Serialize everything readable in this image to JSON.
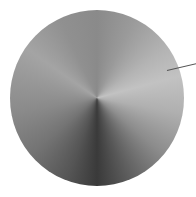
{
  "knob": {
    "type": "rotary-knob",
    "style": "brushed-metal conic",
    "indicator_angle_deg": 77,
    "colors": {
      "highlight": "#c2c2c2",
      "midtone": "#8a8a8a",
      "shadow": "#3a3a3a",
      "indicator": "#555555"
    }
  }
}
